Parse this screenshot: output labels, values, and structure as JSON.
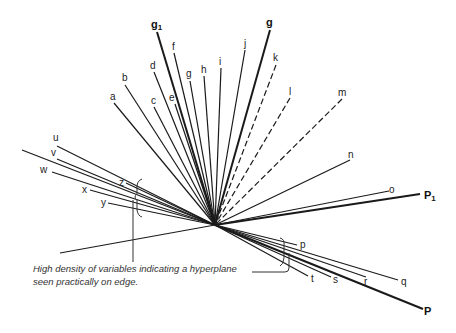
{
  "diagram": {
    "center": [
      215,
      225
    ],
    "vectors": [
      {
        "label": "g1",
        "start": [
          157,
          32
        ],
        "label_pos": [
          151,
          28
        ],
        "bold": true,
        "dashed": false,
        "width": 2
      },
      {
        "label": "f",
        "start": [
          174,
          53
        ],
        "label_pos": [
          172,
          50
        ],
        "bold": false,
        "dashed": false,
        "width": 1.2
      },
      {
        "label": "d",
        "start": [
          154,
          72
        ],
        "label_pos": [
          150,
          69
        ],
        "bold": false,
        "dashed": false,
        "width": 1.2
      },
      {
        "label": "b",
        "start": [
          125,
          85
        ],
        "label_pos": [
          122,
          81
        ],
        "bold": false,
        "dashed": false,
        "width": 1.2
      },
      {
        "label": "a",
        "start": [
          114,
          103
        ],
        "label_pos": [
          110,
          100
        ],
        "bold": false,
        "dashed": false,
        "width": 1.2
      },
      {
        "label": "c",
        "start": [
          154,
          107
        ],
        "label_pos": [
          151,
          104
        ],
        "bold": false,
        "dashed": false,
        "width": 1.2
      },
      {
        "label": "e",
        "start": [
          175,
          104
        ],
        "label_pos": [
          169,
          101
        ],
        "bold": false,
        "dashed": false,
        "width": 1.2
      },
      {
        "label": "g",
        "start": [
          190,
          81
        ],
        "label_pos": [
          186,
          77
        ],
        "bold": false,
        "dashed": false,
        "width": 1.2
      },
      {
        "label": "h",
        "start": [
          204,
          76
        ],
        "label_pos": [
          201,
          73
        ],
        "bold": false,
        "dashed": false,
        "width": 1.2
      },
      {
        "label": "i",
        "start": [
          221,
          68
        ],
        "label_pos": [
          219,
          65
        ],
        "bold": false,
        "dashed": false,
        "width": 1.2
      },
      {
        "label": "j",
        "start": [
          245,
          50
        ],
        "label_pos": [
          244,
          47
        ],
        "bold": false,
        "dashed": false,
        "width": 1.2
      },
      {
        "label": "g",
        "start": [
          270,
          30
        ],
        "label_pos": [
          266,
          26
        ],
        "bold": true,
        "dashed": false,
        "width": 2
      },
      {
        "label": "k",
        "start": [
          276,
          65
        ],
        "label_pos": [
          273,
          61
        ],
        "bold": false,
        "dashed": true,
        "width": 1.2
      },
      {
        "label": "l",
        "start": [
          290,
          98
        ],
        "label_pos": [
          289,
          95
        ],
        "bold": false,
        "dashed": true,
        "width": 1.2
      },
      {
        "label": "m",
        "start": [
          342,
          99
        ],
        "label_pos": [
          338,
          96
        ],
        "bold": false,
        "dashed": true,
        "width": 1.2
      },
      {
        "label": "n",
        "start": [
          350,
          160
        ],
        "label_pos": [
          348,
          158
        ],
        "bold": false,
        "dashed": false,
        "width": 1.2
      },
      {
        "label": "o",
        "start": [
          389,
          191
        ],
        "label_pos": [
          389,
          193
        ],
        "bold": false,
        "dashed": false,
        "width": 1.2
      },
      {
        "label": "P1",
        "start": [
          420,
          194
        ],
        "label_pos": [
          424,
          199
        ],
        "bold": true,
        "dashed": false,
        "width": 2
      },
      {
        "label": "u",
        "start": [
          57,
          146
        ],
        "label_pos": [
          53,
          141
        ],
        "bold": false,
        "dashed": false,
        "width": 1.2
      },
      {
        "label": "",
        "start": [
          22,
          150
        ],
        "label_pos": [
          0,
          0
        ],
        "bold": false,
        "dashed": false,
        "width": 1.2
      },
      {
        "label": "v",
        "start": [
          57,
          159
        ],
        "label_pos": [
          51,
          156
        ],
        "bold": false,
        "dashed": false,
        "width": 1.2
      },
      {
        "label": "w",
        "start": [
          52,
          172
        ],
        "label_pos": [
          40,
          173
        ],
        "bold": false,
        "dashed": false,
        "width": 1.2
      },
      {
        "label": "z",
        "start": [
          126,
          183
        ],
        "label_pos": [
          119,
          186
        ],
        "bold": false,
        "dashed": false,
        "width": 1.2
      },
      {
        "label": "x",
        "start": [
          90,
          190
        ],
        "label_pos": [
          82,
          193
        ],
        "bold": false,
        "dashed": false,
        "width": 1.2
      },
      {
        "label": "y",
        "start": [
          108,
          203
        ],
        "label_pos": [
          101,
          206
        ],
        "bold": false,
        "dashed": false,
        "width": 1.2
      },
      {
        "label": "",
        "start": [
          60,
          253
        ],
        "label_pos": [
          0,
          0
        ],
        "bold": false,
        "dashed": false,
        "width": 1.2
      },
      {
        "label": "p",
        "start": [
          297,
          245
        ],
        "label_pos": [
          300,
          248
        ],
        "bold": false,
        "dashed": false,
        "width": 1.2
      },
      {
        "label": "t",
        "start": [
          308,
          276
        ],
        "label_pos": [
          311,
          282
        ],
        "bold": false,
        "dashed": false,
        "width": 1.2
      },
      {
        "label": "s",
        "start": [
          331,
          277
        ],
        "label_pos": [
          333,
          283
        ],
        "bold": false,
        "dashed": false,
        "width": 1.2
      },
      {
        "label": "r",
        "start": [
          366,
          277
        ],
        "label_pos": [
          364,
          285
        ],
        "bold": false,
        "dashed": false,
        "width": 1.2
      },
      {
        "label": "q",
        "start": [
          398,
          280
        ],
        "label_pos": [
          401,
          285
        ],
        "bold": false,
        "dashed": false,
        "width": 1.2
      },
      {
        "label": "P",
        "start": [
          423,
          309
        ],
        "label_pos": [
          424,
          315
        ],
        "bold": true,
        "dashed": false,
        "width": 2
      }
    ],
    "annotation": {
      "line1": "High density of variables indicating a hyperplane",
      "line2": "seen practically on edge."
    }
  }
}
